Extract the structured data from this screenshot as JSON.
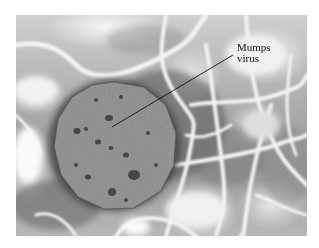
{
  "figure": {
    "label": {
      "line1": "Mumps",
      "line2": "virus"
    },
    "pointer": {
      "from": [
        112,
        127
      ],
      "to": [
        233,
        55
      ]
    },
    "colors": {
      "background": "#ffffff",
      "virion": "#8e8e8e",
      "filaments": "#f0f0f0",
      "text": "#111111"
    }
  }
}
